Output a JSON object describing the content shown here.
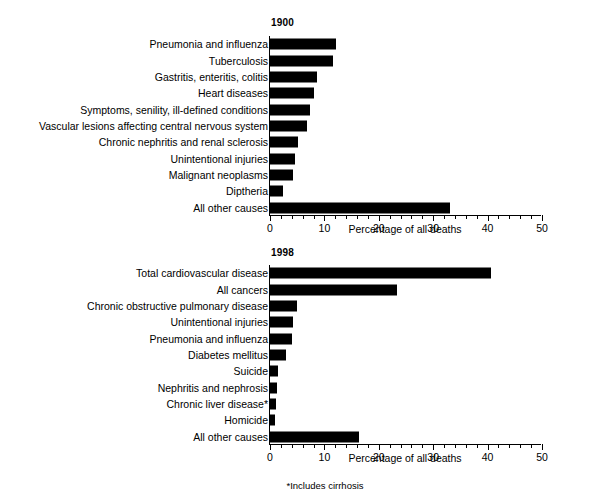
{
  "figure": {
    "footnote": "*Includes cirrhosis"
  },
  "chart_data": [
    {
      "type": "bar",
      "orientation": "horizontal",
      "title": "1900",
      "xlabel": "Percentage of all deaths",
      "ylabel": "",
      "xlim": [
        0,
        50
      ],
      "xticks": [
        0,
        10,
        20,
        30,
        40,
        50
      ],
      "xtick_labels": [
        "0",
        "10",
        "20",
        "30",
        "40",
        "50"
      ],
      "minor_tick_step": 2,
      "grid": false,
      "legend": "none",
      "bar_color": "#000000",
      "categories": [
        "Pneumonia and influenza",
        "Tuberculosis",
        "Gastritis, enteritis, colitis",
        "Heart diseases",
        "Symptoms, senility, ill-defined conditions",
        "Vascular lesions affecting central nervous system",
        "Chronic nephritis and renal sclerosis",
        "Unintentional injuries",
        "Malignant neoplasms",
        "Diptheria",
        "All other causes"
      ],
      "values": [
        12.2,
        11.6,
        8.7,
        8.1,
        7.4,
        6.8,
        5.2,
        4.6,
        4.2,
        2.3,
        33.0
      ]
    },
    {
      "type": "bar",
      "orientation": "horizontal",
      "title": "1998",
      "xlabel": "Percentage of all deaths",
      "ylabel": "",
      "xlim": [
        0,
        50
      ],
      "xticks": [
        0,
        10,
        20,
        30,
        40,
        50
      ],
      "xtick_labels": [
        "0",
        "10",
        "20",
        "30",
        "40",
        "50"
      ],
      "minor_tick_step": 2,
      "grid": false,
      "legend": "none",
      "bar_color": "#000000",
      "categories": [
        "Total cardiovascular disease",
        "All cancers",
        "Chronic obstructive pulmonary disease",
        "Unintentional injuries",
        "Pneumonia and influenza",
        "Diabetes mellitus",
        "Suicide",
        "Nephritis and nephrosis",
        "Chronic liver disease*",
        "Homicide",
        "All other causes"
      ],
      "values": [
        40.6,
        23.3,
        4.9,
        4.3,
        4.0,
        3.0,
        1.4,
        1.2,
        1.1,
        0.9,
        16.4
      ]
    }
  ]
}
